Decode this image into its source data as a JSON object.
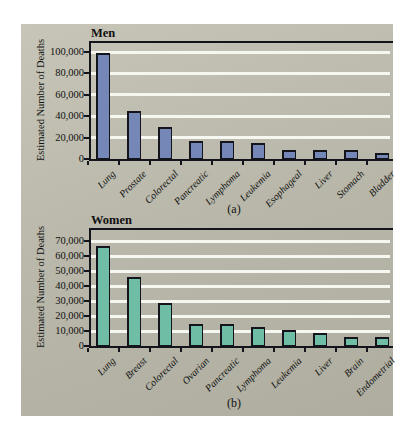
{
  "colors": {
    "page_background": "#ffffff",
    "panel_background": "#b8b7a9",
    "men_bar_fill": "#7487b7",
    "women_bar_fill": "#6fbda4",
    "bar_outline": "#14141c",
    "gridline": "#f7f7f1",
    "axis": "#14141c",
    "text": "#111111"
  },
  "chart_data": [
    {
      "type": "bar",
      "title": "Men",
      "panel_label": "(a)",
      "ylabel": "Estimated Number of Deaths",
      "xlabel": "",
      "legend": "none",
      "grid": "horizontal white gridlines on gray panel",
      "categories": [
        "Lung",
        "Prostate",
        "Colorectal",
        "Pancreatic",
        "Lymphoma",
        "Leukemia",
        "Esophageal",
        "Liver",
        "Stomach",
        "Bladder"
      ],
      "values": [
        99000,
        45000,
        29500,
        17000,
        17000,
        14500,
        8000,
        8500,
        8500,
        6000
      ],
      "ytick_values": [
        0,
        20000,
        40000,
        60000,
        80000,
        100000
      ],
      "ytick_labels": [
        "0",
        "20,000",
        "40,000",
        "60,000",
        "80,000",
        "100,000"
      ],
      "ylim": [
        0,
        110000
      ],
      "bar_color": "#7487b7"
    },
    {
      "type": "bar",
      "title": "Women",
      "panel_label": "(b)",
      "ylabel": "Estimated Number of Deaths",
      "xlabel": "",
      "legend": "none",
      "grid": "horizontal white gridlines on gray panel",
      "categories": [
        "Lung",
        "Breast",
        "Colorectal",
        "Ovarian",
        "Pancreatic",
        "Lymphoma",
        "Leukemia",
        "Liver",
        "Brain",
        "Endometrial"
      ],
      "values": [
        67000,
        46000,
        29000,
        15000,
        14500,
        12500,
        11000,
        8500,
        6000,
        6000
      ],
      "ytick_values": [
        0,
        10000,
        20000,
        30000,
        40000,
        50000,
        60000,
        70000
      ],
      "ytick_labels": [
        "0",
        "10,000",
        "20,000",
        "30,000",
        "40,000",
        "50,000",
        "60,000",
        "70,000"
      ],
      "ylim": [
        0,
        78000
      ],
      "bar_color": "#6fbda4"
    }
  ]
}
